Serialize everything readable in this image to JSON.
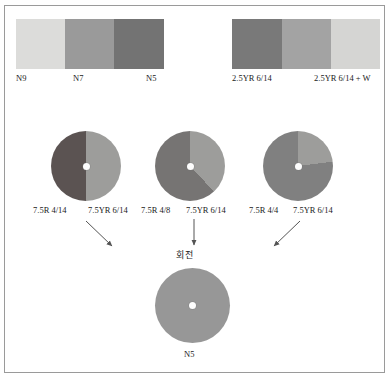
{
  "figure": {
    "background": "#ffffff",
    "frame_color": "#9a9a9a"
  },
  "swatch_strips": [
    {
      "name": "neutral-gray-strip",
      "cells": [
        {
          "label": "N9",
          "color": "#dcdcda"
        },
        {
          "label": "N7",
          "color": "#9a9a9a"
        },
        {
          "label": "N5",
          "color": "#737373"
        }
      ],
      "labels": [
        "N9",
        "N7",
        "N5"
      ]
    },
    {
      "name": "chromatic-strip",
      "cells": [
        {
          "label": "2.5YR 6/14",
          "color": "#797979"
        },
        {
          "label": "",
          "color": "#a3a3a3"
        },
        {
          "label": "2.5YR 6/14 + W",
          "color": "#d5d5d3"
        }
      ],
      "labels": [
        "2.5YR 6/14",
        "2.5YR 6/14 + W"
      ]
    }
  ],
  "discs": [
    {
      "name": "disc-1",
      "left_label": "7.5R 4/14",
      "right_label": "7.5YR 6/14",
      "dark_color": "#5b5352",
      "light_color": "#9d9d9b",
      "dark_fraction": 0.5
    },
    {
      "name": "disc-2",
      "left_label": "7.5R 4/8",
      "right_label": "7.5YR 6/14",
      "dark_color": "#767473",
      "light_color": "#9d9d9b",
      "dark_fraction": 0.62
    },
    {
      "name": "disc-3",
      "left_label": "7.5R 4/4",
      "right_label": "7.5YR 6/14",
      "dark_color": "#808080",
      "light_color": "#9d9d9b",
      "dark_fraction": 0.77
    }
  ],
  "rotation": {
    "caption": "회전"
  },
  "result_disc": {
    "name": "result-disc",
    "label": "N5",
    "color": "#979797"
  }
}
